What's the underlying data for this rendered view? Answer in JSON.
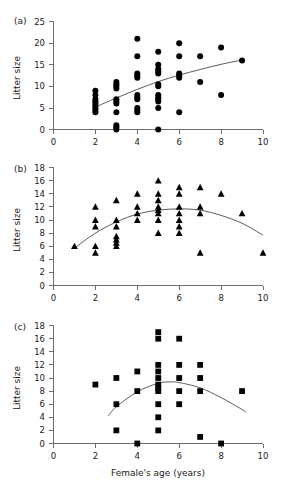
{
  "figure": {
    "xlabel": "Female's age (years)",
    "ylabel": "Litter size",
    "panel_labels": {
      "a": "(a)",
      "b": "(b)",
      "c": "(c)"
    }
  },
  "chart_data": [
    {
      "type": "scatter",
      "panel": "(a)",
      "title": "",
      "xlabel": "",
      "ylabel": "Litter size",
      "xlim": [
        0,
        10
      ],
      "ylim": [
        0,
        25
      ],
      "xticks": [
        0,
        2,
        4,
        6,
        8,
        10
      ],
      "yticks": [
        0,
        5,
        10,
        15,
        20,
        25
      ],
      "grid": false,
      "legend": "none",
      "marker": "filled-circle",
      "points": [
        [
          2,
          9
        ],
        [
          2,
          8
        ],
        [
          2,
          7
        ],
        [
          2,
          6.5
        ],
        [
          2,
          6
        ],
        [
          2,
          5.5
        ],
        [
          2,
          5
        ],
        [
          2,
          4.5
        ],
        [
          2,
          4
        ],
        [
          3,
          11
        ],
        [
          3,
          10.5
        ],
        [
          3,
          10
        ],
        [
          3,
          9.5
        ],
        [
          3,
          7
        ],
        [
          3,
          6.5
        ],
        [
          3,
          6
        ],
        [
          3,
          4
        ],
        [
          3,
          1
        ],
        [
          3,
          0.5
        ],
        [
          3,
          0
        ],
        [
          4,
          21
        ],
        [
          4,
          17
        ],
        [
          4,
          13
        ],
        [
          4,
          12.5
        ],
        [
          4,
          12
        ],
        [
          4,
          8
        ],
        [
          4,
          7.5
        ],
        [
          4,
          7
        ],
        [
          4,
          5
        ],
        [
          4,
          4.5
        ],
        [
          4,
          4
        ],
        [
          5,
          18
        ],
        [
          5,
          15
        ],
        [
          5,
          14
        ],
        [
          5,
          13.5
        ],
        [
          5,
          13
        ],
        [
          5,
          10.5
        ],
        [
          5,
          10
        ],
        [
          5,
          8
        ],
        [
          5,
          7.5
        ],
        [
          5,
          7
        ],
        [
          5,
          6.5
        ],
        [
          5,
          5
        ],
        [
          5,
          0
        ],
        [
          6,
          20
        ],
        [
          6,
          17
        ],
        [
          6,
          13
        ],
        [
          6,
          12.5
        ],
        [
          6,
          12
        ],
        [
          6,
          4
        ],
        [
          7,
          17
        ],
        [
          7,
          11
        ],
        [
          8,
          19
        ],
        [
          8,
          8
        ],
        [
          9,
          16
        ]
      ],
      "fit": {
        "kind": "curve",
        "description": "increasing concave fit",
        "x_range": [
          2,
          9
        ],
        "points": [
          [
            2,
            5.2
          ],
          [
            3,
            7.3
          ],
          [
            4,
            9.3
          ],
          [
            5,
            11.1
          ],
          [
            6,
            12.6
          ],
          [
            7,
            13.9
          ],
          [
            8,
            15.1
          ],
          [
            9,
            16.1
          ]
        ]
      }
    },
    {
      "type": "scatter",
      "panel": "(b)",
      "title": "",
      "xlabel": "",
      "ylabel": "Litter size",
      "xlim": [
        0,
        10
      ],
      "ylim": [
        0,
        18
      ],
      "xticks": [
        0,
        2,
        4,
        6,
        8,
        10
      ],
      "yticks": [
        0,
        2,
        4,
        6,
        8,
        10,
        12,
        14,
        16,
        18
      ],
      "grid": false,
      "legend": "none",
      "marker": "filled-triangle",
      "points": [
        [
          1,
          6
        ],
        [
          2,
          12
        ],
        [
          2,
          10
        ],
        [
          2,
          9
        ],
        [
          2,
          6
        ],
        [
          2,
          5
        ],
        [
          3,
          13
        ],
        [
          3,
          10
        ],
        [
          3,
          9
        ],
        [
          3,
          7.5
        ],
        [
          3,
          7
        ],
        [
          3,
          6.5
        ],
        [
          3,
          6
        ],
        [
          4,
          14
        ],
        [
          4,
          12
        ],
        [
          4,
          11
        ],
        [
          4,
          10
        ],
        [
          5,
          16
        ],
        [
          5,
          14
        ],
        [
          5,
          13
        ],
        [
          5,
          12
        ],
        [
          5,
          11.5
        ],
        [
          5,
          11
        ],
        [
          5,
          10
        ],
        [
          5,
          8
        ],
        [
          6,
          15
        ],
        [
          6,
          14
        ],
        [
          6,
          12
        ],
        [
          6,
          11
        ],
        [
          6,
          10
        ],
        [
          6,
          9
        ],
        [
          6,
          8
        ],
        [
          7,
          15
        ],
        [
          7,
          12
        ],
        [
          7,
          11
        ],
        [
          7,
          5
        ],
        [
          8,
          14
        ],
        [
          9,
          11
        ],
        [
          10,
          5
        ]
      ],
      "fit": {
        "kind": "curve",
        "description": "quadratic hump peaking near x=6.5",
        "x_range": [
          1,
          10
        ],
        "points": [
          [
            1,
            5.7
          ],
          [
            2,
            8.0
          ],
          [
            3,
            9.7
          ],
          [
            4,
            10.9
          ],
          [
            5,
            11.5
          ],
          [
            6,
            11.7
          ],
          [
            7,
            11.5
          ],
          [
            8,
            10.7
          ],
          [
            9,
            9.5
          ],
          [
            10,
            7.7
          ]
        ]
      }
    },
    {
      "type": "scatter",
      "panel": "(c)",
      "title": "",
      "xlabel": "Female's age (years)",
      "ylabel": "Litter size",
      "xlim": [
        0,
        10
      ],
      "ylim": [
        0,
        18
      ],
      "xticks": [
        0,
        2,
        4,
        6,
        8,
        10
      ],
      "yticks": [
        0,
        2,
        4,
        6,
        8,
        10,
        12,
        14,
        16,
        18
      ],
      "grid": false,
      "legend": "none",
      "marker": "filled-square",
      "points": [
        [
          2,
          9
        ],
        [
          3,
          10
        ],
        [
          3,
          6
        ],
        [
          3,
          2
        ],
        [
          4,
          11
        ],
        [
          4,
          8
        ],
        [
          4,
          0
        ],
        [
          5,
          17
        ],
        [
          5,
          16
        ],
        [
          5,
          12
        ],
        [
          5,
          11
        ],
        [
          5,
          10
        ],
        [
          5,
          9
        ],
        [
          5,
          8.5
        ],
        [
          5,
          8
        ],
        [
          5,
          6
        ],
        [
          5,
          4
        ],
        [
          5,
          2
        ],
        [
          6,
          16
        ],
        [
          6,
          12
        ],
        [
          6,
          10
        ],
        [
          6,
          8
        ],
        [
          6,
          6
        ],
        [
          7,
          12
        ],
        [
          7,
          10
        ],
        [
          7,
          8
        ],
        [
          7,
          1
        ],
        [
          8,
          0
        ],
        [
          9,
          8
        ]
      ],
      "fit": {
        "kind": "curve",
        "description": "quadratic hump peaking near x=5.5",
        "x_range": [
          2.6,
          9.2
        ],
        "points": [
          [
            2.6,
            4.2
          ],
          [
            3,
            5.6
          ],
          [
            4,
            7.9
          ],
          [
            5,
            9.2
          ],
          [
            5.6,
            9.4
          ],
          [
            6,
            9.3
          ],
          [
            7,
            8.5
          ],
          [
            8,
            7.0
          ],
          [
            9,
            5.2
          ],
          [
            9.2,
            4.8
          ]
        ]
      }
    }
  ]
}
